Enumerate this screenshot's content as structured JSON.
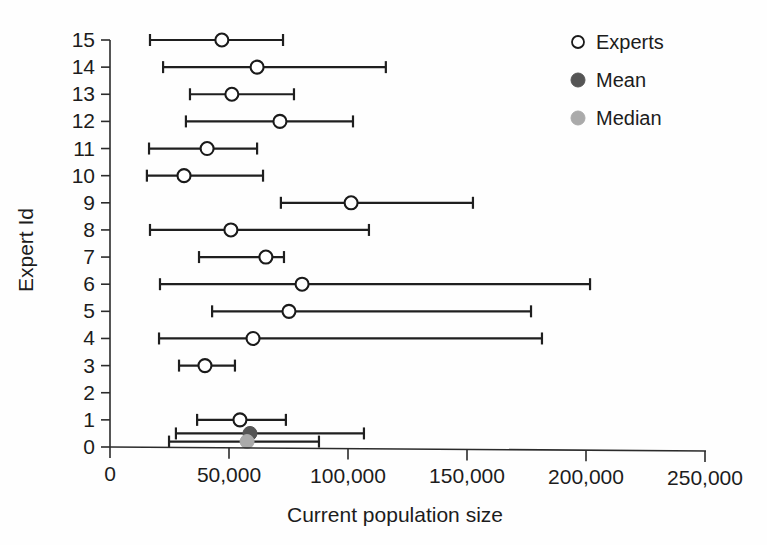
{
  "chart_data": {
    "type": "scatter",
    "title": "",
    "xlabel": "Current population size",
    "ylabel": "Expert Id",
    "xlim": [
      0,
      250000
    ],
    "ylim": [
      0,
      15.6
    ],
    "grid": false,
    "legend_position": "top-right",
    "x_ticks": [
      {
        "value": 0,
        "label": "0"
      },
      {
        "value": 50000,
        "label": "50,000"
      },
      {
        "value": 100000,
        "label": "100,000"
      },
      {
        "value": 150000,
        "label": "150,000"
      },
      {
        "value": 200000,
        "label": "200,000"
      },
      {
        "value": 250000,
        "label": "250,000"
      }
    ],
    "y_ticks": [
      {
        "value": 0,
        "label": "0"
      },
      {
        "value": 1,
        "label": "1"
      },
      {
        "value": 2,
        "label": "2"
      },
      {
        "value": 3,
        "label": "3"
      },
      {
        "value": 4,
        "label": "4"
      },
      {
        "value": 5,
        "label": "5"
      },
      {
        "value": 6,
        "label": "6"
      },
      {
        "value": 7,
        "label": "7"
      },
      {
        "value": 8,
        "label": "8"
      },
      {
        "value": 9,
        "label": "9"
      },
      {
        "value": 10,
        "label": "10"
      },
      {
        "value": 11,
        "label": "11"
      },
      {
        "value": 12,
        "label": "12"
      },
      {
        "value": 13,
        "label": "13"
      },
      {
        "value": 14,
        "label": "14"
      },
      {
        "value": 15,
        "label": "15"
      }
    ],
    "series": [
      {
        "name": "Experts",
        "marker": "open-circle",
        "color": "#1a1a1a",
        "fill": "#ffffff",
        "points": [
          {
            "y": 15,
            "low": 16800,
            "estimate": 47000,
            "high": 72700
          },
          {
            "y": 14,
            "low": 22300,
            "estimate": 61800,
            "high": 115900
          },
          {
            "y": 13,
            "low": 33600,
            "estimate": 51200,
            "high": 77300
          },
          {
            "y": 12,
            "low": 31900,
            "estimate": 71400,
            "high": 102100
          },
          {
            "y": 11,
            "low": 16400,
            "estimate": 40800,
            "high": 61800
          },
          {
            "y": 10,
            "low": 15500,
            "estimate": 31100,
            "high": 64300
          },
          {
            "y": 9,
            "low": 71800,
            "estimate": 101300,
            "high": 152500
          },
          {
            "y": 8,
            "low": 16800,
            "estimate": 50800,
            "high": 108800
          },
          {
            "y": 7,
            "low": 37400,
            "estimate": 65500,
            "high": 73100
          },
          {
            "y": 6,
            "low": 21000,
            "estimate": 80700,
            "high": 201700
          },
          {
            "y": 5,
            "low": 42900,
            "estimate": 75200,
            "high": 176900
          },
          {
            "y": 4,
            "low": 20600,
            "estimate": 60100,
            "high": 181500
          },
          {
            "y": 3,
            "low": 29000,
            "estimate": 39900,
            "high": 52500
          },
          {
            "y": 1,
            "low": 36600,
            "estimate": 54600,
            "high": 73900
          }
        ]
      },
      {
        "name": "Mean",
        "marker": "filled-circle",
        "color": "#555555",
        "points": [
          {
            "y": 0.5,
            "low": 27700,
            "estimate": 58800,
            "high": 106700
          }
        ]
      },
      {
        "name": "Median",
        "marker": "filled-circle",
        "color": "#aaaaaa",
        "points": [
          {
            "y": 0.2,
            "low": 24800,
            "estimate": 57600,
            "high": 87800
          }
        ]
      }
    ]
  },
  "legend": {
    "items": [
      {
        "label": "Experts",
        "marker": "open-circle",
        "color": "#1a1a1a"
      },
      {
        "label": "Mean",
        "marker": "filled-circle",
        "color": "#555555"
      },
      {
        "label": "Median",
        "marker": "filled-circle",
        "color": "#aaaaaa"
      }
    ]
  },
  "axes": {
    "x_title": "Current population size",
    "y_title": "Expert Id"
  }
}
